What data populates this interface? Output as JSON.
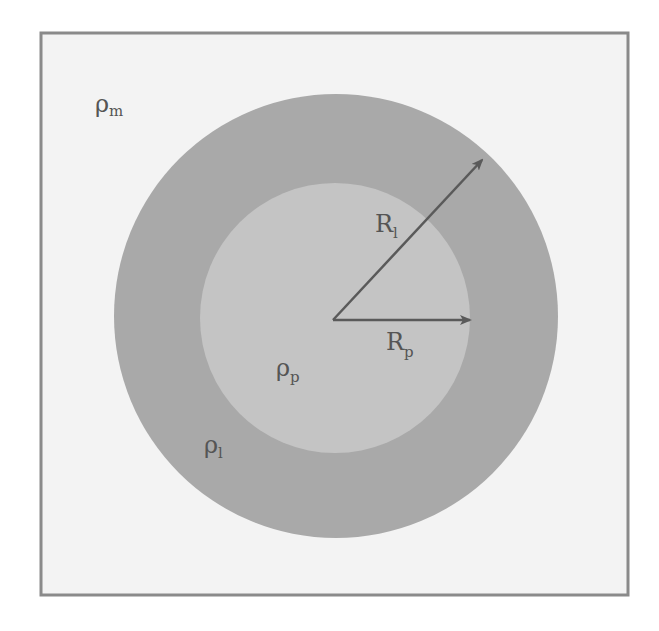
{
  "diagram": {
    "type": "concentric-circles",
    "colors": {
      "page_background": "#ffffff",
      "frame_fill": "#f3f3f3",
      "frame_stroke": "#8a8a8a",
      "outer_layer_fill": "#a9a9a9",
      "inner_particle_fill": "#c4c4c4",
      "arrow_color": "#5a5a5a",
      "label_color": "#555555"
    },
    "regions": {
      "matrix": {
        "symbol": "ρ",
        "subscript": "m"
      },
      "layer": {
        "symbol": "ρ",
        "subscript": "l"
      },
      "particle": {
        "symbol": "ρ",
        "subscript": "p"
      }
    },
    "radii": {
      "outer": {
        "symbol": "R",
        "subscript": "l"
      },
      "inner": {
        "symbol": "R",
        "subscript": "p"
      }
    }
  }
}
